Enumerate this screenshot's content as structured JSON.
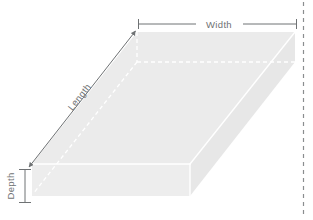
{
  "diagram": {
    "shape": "rectangular-box",
    "labels": {
      "width": "Width",
      "length": "Length",
      "depth": "Depth"
    },
    "colors": {
      "face_top": "#ebebeb",
      "face_front": "#ededed",
      "face_right": "#e6e6e6",
      "hidden_edge": "#ffffff",
      "visible_edge": "#ffffff",
      "dimension_line": "#6f7274",
      "label_text": "#6f7274",
      "guide_dashed": "#8a8d8f",
      "background": "#ffffff"
    },
    "geometry": {
      "top_face": [
        [
          137,
          32
        ],
        [
          295,
          32
        ],
        [
          190,
          164
        ],
        [
          32,
          164
        ]
      ],
      "front_face": [
        [
          32,
          164
        ],
        [
          190,
          164
        ],
        [
          190,
          196
        ],
        [
          32,
          196
        ]
      ],
      "right_face": [
        [
          190,
          164
        ],
        [
          295,
          32
        ],
        [
          295,
          62
        ],
        [
          190,
          196
        ]
      ],
      "hidden_edges": [
        [
          [
            137,
            62
          ],
          [
            295,
            62
          ]
        ],
        [
          [
            137,
            62
          ],
          [
            32,
            196
          ]
        ],
        [
          [
            137,
            32
          ],
          [
            137,
            62
          ]
        ]
      ]
    },
    "dimensions": {
      "width_line": {
        "y": 24,
        "x_start": 138,
        "x_end": 297,
        "gap_start": 196,
        "gap_end": 243
      },
      "length_line": {
        "x_start": 29,
        "y_start": 166,
        "x_end": 135,
        "y_end": 31
      },
      "depth_line": {
        "x": 25,
        "y_start": 168,
        "y_end": 203
      }
    },
    "guide_line": {
      "x": 303,
      "y_start": 2,
      "y_end": 218,
      "style": "dashed"
    }
  }
}
